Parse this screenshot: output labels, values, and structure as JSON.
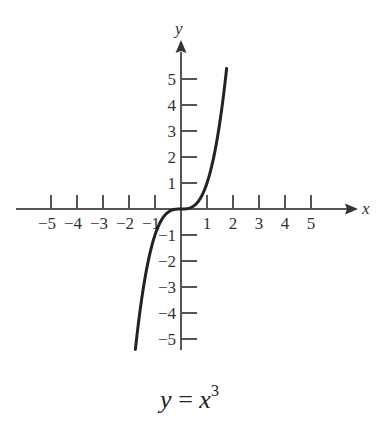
{
  "chart_data": {
    "type": "line",
    "xlabel": "x",
    "ylabel": "y",
    "xlim": [
      -5.5,
      6
    ],
    "ylim": [
      -5.5,
      6
    ],
    "grid": false,
    "x_ticks": [
      -5,
      -4,
      -3,
      -2,
      -1,
      1,
      2,
      3,
      4,
      5
    ],
    "y_ticks": [
      -5,
      -4,
      -3,
      -2,
      -1,
      1,
      2,
      3,
      4,
      5
    ],
    "x_tick_labels": [
      "−5",
      "−4",
      "−3",
      "−2",
      "−1",
      "1",
      "2",
      "3",
      "4",
      "5"
    ],
    "y_tick_labels": [
      "−5",
      "−4",
      "−3",
      "−2",
      "−1",
      "1",
      "2",
      "3",
      "4",
      "5"
    ],
    "series": [
      {
        "name": "y = x^3",
        "function": "x^3",
        "x": [
          -1.75,
          -1.5,
          -1.25,
          -1.0,
          -0.75,
          -0.5,
          -0.25,
          0,
          0.25,
          0.5,
          0.75,
          1.0,
          1.25,
          1.5,
          1.75
        ],
        "y": [
          -5.36,
          -3.375,
          -1.953,
          -1.0,
          -0.422,
          -0.125,
          -0.016,
          0,
          0.016,
          0.125,
          0.422,
          1.0,
          1.953,
          3.375,
          5.36
        ]
      }
    ],
    "legend": null
  },
  "caption": {
    "lhs": "y",
    "equals": "=",
    "base": "x",
    "exponent": "3"
  },
  "axes": {
    "x_label": "x",
    "y_label": "y"
  }
}
